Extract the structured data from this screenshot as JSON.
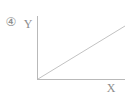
{
  "figure": {
    "item_number": "④",
    "item_number_icon": "circled-number-four-icon"
  },
  "chart_data": {
    "type": "line",
    "title": "",
    "subtitle": "",
    "xlabel": "X",
    "ylabel": "Y",
    "grid": false,
    "legend": false,
    "legend_position": "none",
    "xlim": [
      0,
      10
    ],
    "ylim": [
      0,
      10
    ],
    "x_tick_labels": [],
    "y_tick_labels": [],
    "annotations": [],
    "series": [
      {
        "name": "proportional-line",
        "x": [
          0,
          10
        ],
        "values": [
          0,
          8.5
        ]
      }
    ]
  },
  "axes": {
    "y_axis_label": "Y",
    "x_axis_label": "X",
    "origin_label": "",
    "axis_color": "#b9b9b9",
    "line_color": "#c2c2c2",
    "label_color": "#8d8d8d",
    "background_color": "#ffffff"
  }
}
